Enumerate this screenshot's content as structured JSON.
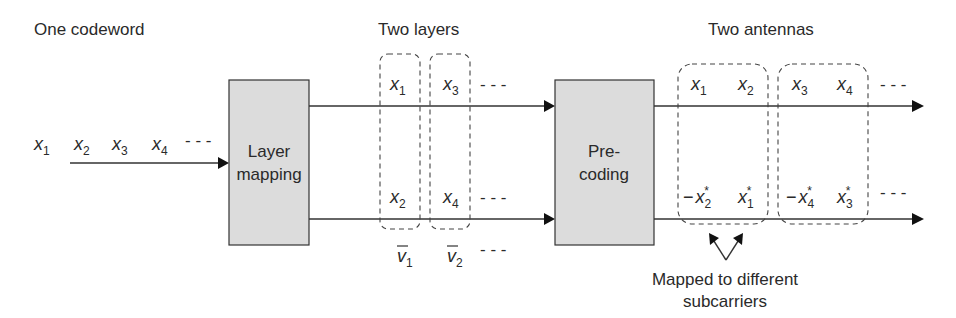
{
  "labels": {
    "codeword": "One codeword",
    "layers": "Two layers",
    "antennas": "Two antennas",
    "note_line1": "Mapped to different",
    "note_line2": "subcarriers"
  },
  "blocks": {
    "layer_mapping": {
      "line1": "Layer",
      "line2": "mapping"
    },
    "precoding": {
      "line1": "Pre-",
      "line2": "coding"
    }
  },
  "input_symbols": [
    {
      "base": "x",
      "sub": "1"
    },
    {
      "base": "x",
      "sub": "2"
    },
    {
      "base": "x",
      "sub": "3"
    },
    {
      "base": "x",
      "sub": "4"
    }
  ],
  "ellipsis": "- - -",
  "layers": {
    "top": [
      {
        "base": "x",
        "sub": "1"
      },
      {
        "base": "x",
        "sub": "3"
      }
    ],
    "bottom": [
      {
        "base": "x",
        "sub": "2"
      },
      {
        "base": "x",
        "sub": "4"
      }
    ],
    "vectors": [
      {
        "base": "v",
        "sub": "1"
      },
      {
        "base": "v",
        "sub": "2"
      }
    ]
  },
  "antennas": {
    "top": [
      {
        "base": "x",
        "sub": "1"
      },
      {
        "base": "x",
        "sub": "2"
      },
      {
        "base": "x",
        "sub": "3"
      },
      {
        "base": "x",
        "sub": "4"
      }
    ],
    "bottom": [
      {
        "prefix": "−",
        "base": "x",
        "sub": "2",
        "sup": "*"
      },
      {
        "prefix": "",
        "base": "x",
        "sub": "1",
        "sup": "*"
      },
      {
        "prefix": "−",
        "base": "x",
        "sub": "4",
        "sup": "*"
      },
      {
        "prefix": "",
        "base": "x",
        "sub": "3",
        "sup": "*"
      }
    ]
  },
  "colors": {
    "block_fill": "#dcdcdc",
    "stroke": "#333333",
    "text": "#2a2a2a"
  }
}
